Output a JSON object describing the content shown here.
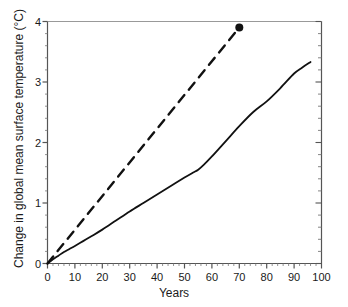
{
  "chart_data": {
    "type": "line",
    "title": "",
    "xlabel": "Years",
    "ylabel": "Change in global mean surface temperature (°C)",
    "xlim": [
      0,
      100
    ],
    "ylim": [
      0,
      4
    ],
    "grid": false,
    "legend": "none",
    "xticks": [
      "0",
      "10",
      "20",
      "30",
      "40",
      "50",
      "60",
      "70",
      "80",
      "90",
      "100"
    ],
    "xtick_values": [
      0,
      10,
      20,
      30,
      40,
      50,
      60,
      70,
      80,
      90,
      100
    ],
    "yticks": [
      "0",
      "1",
      "2",
      "3",
      "4"
    ],
    "ytick_values": [
      0,
      1,
      2,
      3,
      4
    ],
    "x_minor_step": 2,
    "y_minor_step": 0.2,
    "series": [
      {
        "name": "solid-curve",
        "style": "solid",
        "color": "#111111",
        "width": 1.8,
        "x": [
          0,
          2,
          4,
          6,
          8,
          10,
          13,
          16,
          20,
          25,
          30,
          35,
          40,
          45,
          50,
          53,
          55,
          57,
          60,
          65,
          70,
          75,
          80,
          85,
          90,
          93,
          96
        ],
        "y": [
          0.0,
          0.07,
          0.13,
          0.19,
          0.24,
          0.29,
          0.37,
          0.45,
          0.56,
          0.71,
          0.86,
          1.0,
          1.14,
          1.28,
          1.42,
          1.5,
          1.55,
          1.63,
          1.77,
          2.02,
          2.27,
          2.5,
          2.68,
          2.9,
          3.14,
          3.24,
          3.33
        ]
      },
      {
        "name": "dashed-line",
        "style": "dashed",
        "color": "#111111",
        "width": 2.4,
        "dash": "9 7",
        "x": [
          0,
          70
        ],
        "y": [
          0.0,
          3.9
        ]
      }
    ],
    "markers": [
      {
        "name": "dashed-line-endpoint",
        "x": 70,
        "y": 3.9,
        "shape": "circle",
        "radius": 4,
        "color": "#111111"
      }
    ],
    "axes_color": "#555555",
    "text_color": "#1a1a1a"
  }
}
